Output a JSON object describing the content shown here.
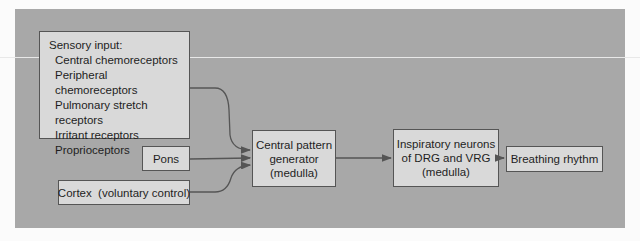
{
  "diagram": {
    "sensory_input": {
      "heading": "Sensory input:",
      "items": [
        "Central chemoreceptors",
        "Peripheral chemoreceptors",
        "Pulmonary stretch receptors",
        "Irritant receptors",
        "Proprioceptors"
      ]
    },
    "pons": "Pons",
    "cortex": "Cortex  (voluntary control)",
    "central_pattern_generator": {
      "line1": "Central pattern",
      "line2": "generator",
      "line3": "(medulla)"
    },
    "inspiratory_neurons": {
      "line1": "Inspiratory neurons",
      "line2": "of DRG and VRG",
      "line3": "(medulla)"
    },
    "output": "Breathing rhythm",
    "colors": {
      "panel": "#a8a8a8",
      "box": "#d9d9d9",
      "stroke": "#555555"
    }
  }
}
